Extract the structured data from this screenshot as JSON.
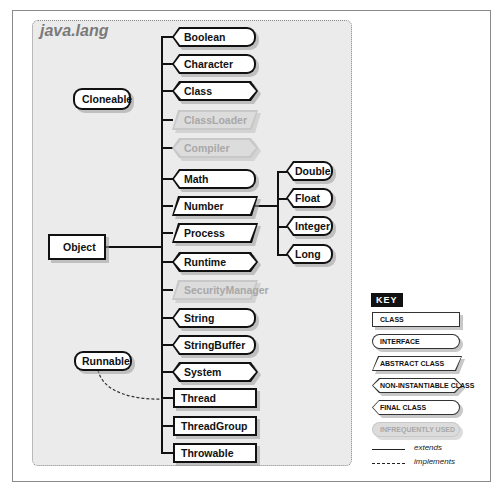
{
  "package": {
    "title": "java.lang"
  },
  "nodes": {
    "object": {
      "label": "Object",
      "kind": "class"
    },
    "cloneable": {
      "label": "Cloneable",
      "kind": "interface"
    },
    "runnable": {
      "label": "Runnable",
      "kind": "interface"
    },
    "boolean": {
      "label": "Boolean",
      "kind": "final"
    },
    "character": {
      "label": "Character",
      "kind": "final"
    },
    "class": {
      "label": "Class",
      "kind": "final-noninstantiable"
    },
    "classloader": {
      "label": "ClassLoader",
      "kind": "abstract",
      "infrequent": true
    },
    "compiler": {
      "label": "Compiler",
      "kind": "non-instantiable",
      "infrequent": true
    },
    "math": {
      "label": "Math",
      "kind": "final"
    },
    "number": {
      "label": "Number",
      "kind": "abstract"
    },
    "process": {
      "label": "Process",
      "kind": "abstract"
    },
    "runtime": {
      "label": "Runtime",
      "kind": "non-instantiable"
    },
    "securitymanager": {
      "label": "SecurityManager",
      "kind": "abstract",
      "infrequent": true
    },
    "string": {
      "label": "String",
      "kind": "final"
    },
    "stringbuffer": {
      "label": "StringBuffer",
      "kind": "final"
    },
    "system": {
      "label": "System",
      "kind": "final-noninstantiable"
    },
    "thread": {
      "label": "Thread",
      "kind": "class"
    },
    "threadgroup": {
      "label": "ThreadGroup",
      "kind": "class"
    },
    "throwable": {
      "label": "Throwable",
      "kind": "class"
    },
    "double": {
      "label": "Double",
      "kind": "final"
    },
    "float": {
      "label": "Float",
      "kind": "final"
    },
    "integer": {
      "label": "Integer",
      "kind": "final"
    },
    "long": {
      "label": "Long",
      "kind": "final"
    }
  },
  "relations": {
    "extends_object": [
      "Boolean",
      "Character",
      "Class",
      "ClassLoader",
      "Compiler",
      "Math",
      "Number",
      "Process",
      "Runtime",
      "SecurityManager",
      "String",
      "StringBuffer",
      "System",
      "Thread",
      "ThreadGroup",
      "Throwable"
    ],
    "extends_number": [
      "Double",
      "Float",
      "Integer",
      "Long"
    ],
    "implements": [
      {
        "from": "Thread",
        "to": "Runnable"
      }
    ]
  },
  "key": {
    "title": "KEY",
    "class": "CLASS",
    "interface": "INTERFACE",
    "abstract": "ABSTRACT CLASS",
    "noninstantiable": "NON-INSTANTIABLE CLASS",
    "final": "FINAL CLASS",
    "infrequent": "INFREQUENTLY USED",
    "extends": "extends",
    "implements": "implements"
  }
}
